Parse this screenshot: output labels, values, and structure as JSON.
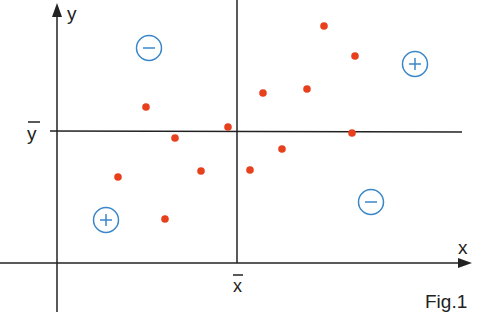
{
  "labels": {
    "y_axis": "y",
    "x_axis": "x",
    "y_mean": "y",
    "x_mean": "x",
    "figure": "Fig.1"
  },
  "quadrant_signs": [
    {
      "quadrant": "top-left",
      "sign": "−",
      "x": 149,
      "y": 48
    },
    {
      "quadrant": "top-right",
      "sign": "+",
      "x": 415,
      "y": 64
    },
    {
      "quadrant": "bottom-left",
      "sign": "+",
      "x": 106,
      "y": 220
    },
    {
      "quadrant": "bottom-right",
      "sign": "−",
      "x": 371,
      "y": 202
    }
  ],
  "colors": {
    "axis": "#222222",
    "point": "#e8401c",
    "sign": "#3a86c8"
  },
  "chart_data": {
    "type": "scatter",
    "title": "Fig.1",
    "xlabel": "x",
    "ylabel": "y",
    "annotations": [
      "x̄ (mean of x) vertical line",
      "ȳ (mean of y) horizontal line",
      "quadrant signs: top-left −, top-right +, bottom-left +, bottom-right −"
    ],
    "points_px": [
      {
        "x": 146,
        "y": 107
      },
      {
        "x": 175,
        "y": 138
      },
      {
        "x": 228,
        "y": 127
      },
      {
        "x": 118,
        "y": 177
      },
      {
        "x": 201,
        "y": 171
      },
      {
        "x": 250,
        "y": 170
      },
      {
        "x": 282,
        "y": 149
      },
      {
        "x": 165,
        "y": 219
      },
      {
        "x": 263,
        "y": 93
      },
      {
        "x": 307,
        "y": 89
      },
      {
        "x": 324,
        "y": 26
      },
      {
        "x": 355,
        "y": 56
      },
      {
        "x": 352,
        "y": 133
      }
    ],
    "grid": false
  }
}
